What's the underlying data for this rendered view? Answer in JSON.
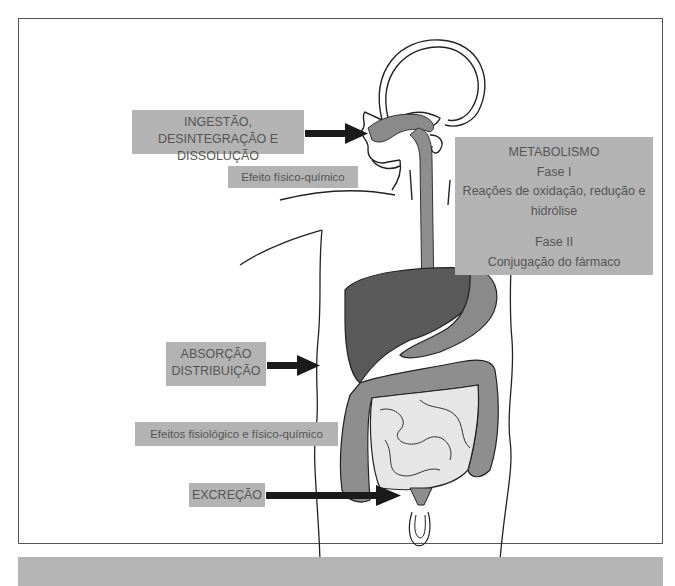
{
  "figure": {
    "labels": {
      "ingestion": {
        "line1": "INGESTÃO, DESINTEGRAÇÃO E",
        "line2": "DISSOLUÇÃO"
      },
      "ingestion_effect": "Efeito físico-químico",
      "metabolism": {
        "title": "METABOLISMO",
        "phase1_title": "Fase I",
        "phase1_line1": "Reações de oxidação, redução e",
        "phase1_line2": "hidrólise",
        "phase2_title": "Fase II",
        "phase2_desc": "Conjugação do fármaco"
      },
      "absorption": {
        "line1": "ABSORÇÃO",
        "line2": "DISTRIBUIÇÃO"
      },
      "absorption_effect": "Efeitos fisiológico e físico-químico",
      "excretion": "EXCREÇÃO"
    },
    "organs": [
      "head",
      "esophagus",
      "liver",
      "stomach",
      "large-intestine",
      "small-intestine",
      "bladder"
    ],
    "colors": {
      "label_bg": "#b3b3b3",
      "liver": "#5a5a5a",
      "stomach": "#8a8a8a",
      "intestine_large": "#8e8e8e",
      "intestine_small": "#e6e6e6",
      "arrow": "#1a1a1a",
      "footer_bar": "#b5b5b5"
    }
  }
}
